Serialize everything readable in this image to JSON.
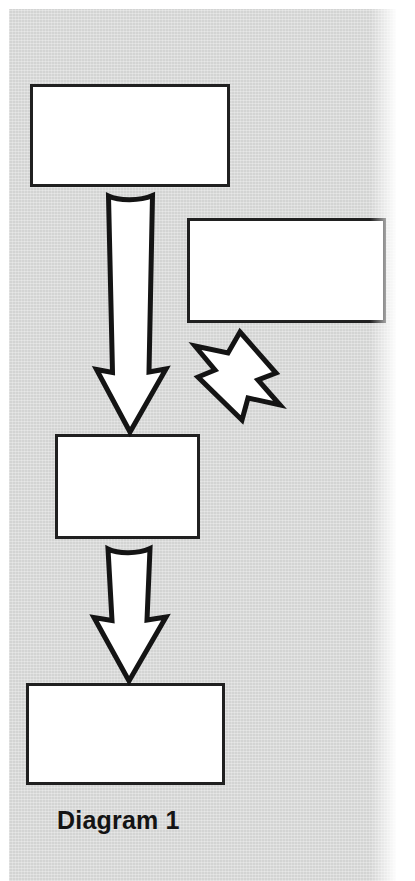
{
  "document": {
    "caption": "Diagram 1",
    "background_color": "#d3d4d3",
    "page_color": "#ffffff",
    "ink_color": "#141414",
    "node_fill": "#ffffff"
  },
  "diagram": {
    "type": "flowchart",
    "caption": "Diagram 1",
    "nodes": [
      {
        "id": "box-1",
        "label": "",
        "x": 30,
        "y": 84,
        "width": 200,
        "height": 103
      },
      {
        "id": "box-2",
        "label": "",
        "x": 187,
        "y": 218,
        "width": 199,
        "height": 105
      },
      {
        "id": "box-3",
        "label": "",
        "x": 55,
        "y": 434,
        "width": 145,
        "height": 105
      },
      {
        "id": "box-4",
        "label": "",
        "x": 26,
        "y": 683,
        "width": 199,
        "height": 102
      }
    ],
    "connectors": [
      {
        "id": "arrow-1",
        "from": "box-1",
        "to": "box-3",
        "direction": "down",
        "style": "block-arrow"
      },
      {
        "id": "arrow-2",
        "from": "box-2",
        "to": "box-3",
        "direction": "down-left",
        "style": "block-arrow"
      },
      {
        "id": "arrow-3",
        "from": "box-3",
        "to": "box-4",
        "direction": "down",
        "style": "block-arrow"
      }
    ]
  }
}
